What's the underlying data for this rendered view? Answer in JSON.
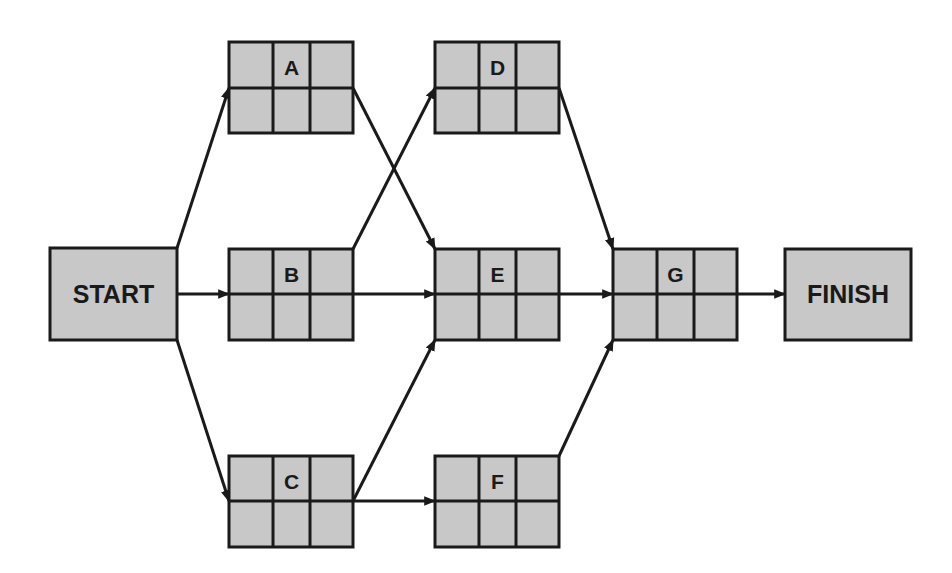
{
  "diagram": {
    "type": "activity-on-node network (CPM/PERT)",
    "colors": {
      "node_fill": "#c8c8c8",
      "stroke": "#1a1a1a",
      "background": "#ffffff"
    },
    "nodes": {
      "start": {
        "label": "START",
        "x": 50,
        "y": 248,
        "w": 127,
        "h": 92
      },
      "a": {
        "label": "A",
        "x": 229,
        "y": 42,
        "w": 124,
        "h": 91
      },
      "b": {
        "label": "B",
        "x": 229,
        "y": 249,
        "w": 124,
        "h": 91
      },
      "c": {
        "label": "C",
        "x": 229,
        "y": 456,
        "w": 124,
        "h": 91
      },
      "d": {
        "label": "D",
        "x": 435,
        "y": 42,
        "w": 124,
        "h": 91
      },
      "e": {
        "label": "E",
        "x": 435,
        "y": 249,
        "w": 124,
        "h": 91
      },
      "f": {
        "label": "F",
        "x": 435,
        "y": 456,
        "w": 124,
        "h": 91
      },
      "g": {
        "label": "G",
        "x": 613,
        "y": 249,
        "w": 124,
        "h": 91
      },
      "finish": {
        "label": "FINISH",
        "x": 785,
        "y": 249,
        "w": 126,
        "h": 91
      }
    },
    "edges": [
      {
        "from": "START",
        "to": "A"
      },
      {
        "from": "START",
        "to": "B"
      },
      {
        "from": "START",
        "to": "C"
      },
      {
        "from": "A",
        "to": "E"
      },
      {
        "from": "B",
        "to": "D"
      },
      {
        "from": "B",
        "to": "E"
      },
      {
        "from": "C",
        "to": "E"
      },
      {
        "from": "C",
        "to": "F"
      },
      {
        "from": "D",
        "to": "G"
      },
      {
        "from": "E",
        "to": "G"
      },
      {
        "from": "F",
        "to": "G"
      },
      {
        "from": "G",
        "to": "FINISH"
      }
    ]
  }
}
